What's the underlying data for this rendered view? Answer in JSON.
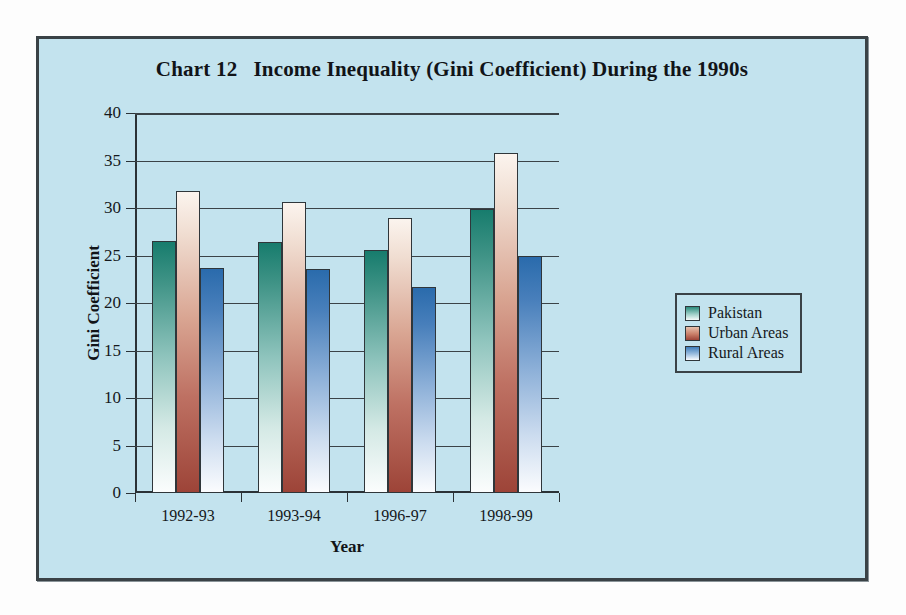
{
  "figure": {
    "title_number": "Chart 12",
    "title_text": "Income Inequality (Gini Coefficient) During the 1990s",
    "background_color": "#c3e3ee",
    "border_color": "#3a4246"
  },
  "legend": {
    "position": "right",
    "entries": [
      {
        "label": "Pakistan",
        "color": "#2b8b7c"
      },
      {
        "label": "Urban Areas",
        "color": "#9d4438"
      },
      {
        "label": "Rural Areas",
        "color": "#3f7ebb"
      }
    ]
  },
  "axes": {
    "y_title": "Gini Coefficient",
    "x_title": "Year",
    "y_ticks": [
      "0",
      "5",
      "10",
      "15",
      "20",
      "25",
      "30",
      "35",
      "40"
    ],
    "x_ticks": [
      "1992-93",
      "1993-94",
      "1996-97",
      "1998-99"
    ]
  },
  "chart_data": {
    "type": "bar",
    "xlabel": "Year",
    "ylabel": "Gini Coefficient",
    "ylim": [
      0,
      40
    ],
    "ytick_step": 5,
    "grid": true,
    "legend_position": "right",
    "categories": [
      "1992-93",
      "1993-94",
      "1996-97",
      "1998-99"
    ],
    "series": [
      {
        "name": "Pakistan",
        "color": "#2b8b7c",
        "values": [
          26.5,
          26.4,
          25.6,
          29.9
        ]
      },
      {
        "name": "Urban Areas",
        "color": "#9d4438",
        "values": [
          31.8,
          30.6,
          28.9,
          35.8
        ]
      },
      {
        "name": "Rural Areas",
        "color": "#3f7ebb",
        "values": [
          23.7,
          23.6,
          21.7,
          24.9
        ]
      }
    ]
  }
}
